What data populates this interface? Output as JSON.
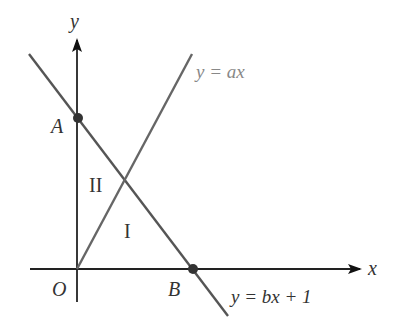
{
  "diagram": {
    "axes": {
      "x_label": "x",
      "y_label": "y",
      "origin_label": "O"
    },
    "lines": [
      {
        "name": "line-ax",
        "equation": "y = ax"
      },
      {
        "name": "line-bx1",
        "equation": "y = bx + 1"
      }
    ],
    "points": [
      {
        "label": "A",
        "description": "y-intercept of y = bx + 1"
      },
      {
        "label": "B",
        "description": "x-intercept of y = bx + 1"
      }
    ],
    "regions": [
      {
        "label": "I"
      },
      {
        "label": "II"
      }
    ],
    "colors": {
      "axis": "#222222",
      "line": "#555555",
      "point": "#333333",
      "label_gray": "#888888"
    }
  }
}
